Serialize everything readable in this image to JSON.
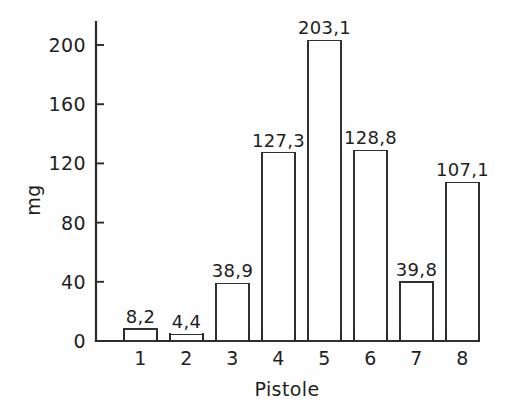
{
  "chart_data": {
    "type": "bar",
    "title": "",
    "subtitle": "",
    "xlabel": "Pistole",
    "ylabel": "mg",
    "categories": [
      "1",
      "2",
      "3",
      "4",
      "5",
      "6",
      "7",
      "8"
    ],
    "values": [
      8.2,
      4.4,
      38.9,
      127.3,
      203.1,
      128.8,
      39.8,
      107.1
    ],
    "value_labels": [
      "8,2",
      "4,4",
      "38,9",
      "127,3",
      "203,1",
      "128,8",
      "39,8",
      "107,1"
    ],
    "ylim": [
      0,
      215
    ],
    "xlim": [
      0,
      8
    ],
    "y_ticks": [
      0,
      40,
      80,
      120,
      160,
      200
    ],
    "y_tick_labels": [
      "0",
      "40",
      "80",
      "120",
      "160",
      "200"
    ],
    "x_tick_labels": [
      "1",
      "2",
      "3",
      "4",
      "5",
      "6",
      "7",
      "8"
    ],
    "grid": false,
    "legend": false,
    "legend_position": "none",
    "decimal_separator": ",",
    "bar_fill": "#ffffff",
    "bar_stroke": "#303030",
    "axis_color": "#2b2b2b",
    "text_color": "#1f1f1f",
    "background": "#fefefe",
    "series": [
      {
        "name": "mg",
        "values": [
          8.2,
          4.4,
          38.9,
          127.3,
          203.1,
          128.8,
          39.8,
          107.1
        ]
      }
    ]
  },
  "geometry": {
    "plot_left": 96,
    "plot_right": 478,
    "baseline_y": 341,
    "y_axis_top": 22,
    "y_value_top": 45,
    "y_value_top_data": 200,
    "bar_width": 33,
    "bar_slot_width": 46,
    "first_bar_left": 124,
    "tick_len": 8,
    "label_gap": 6
  }
}
